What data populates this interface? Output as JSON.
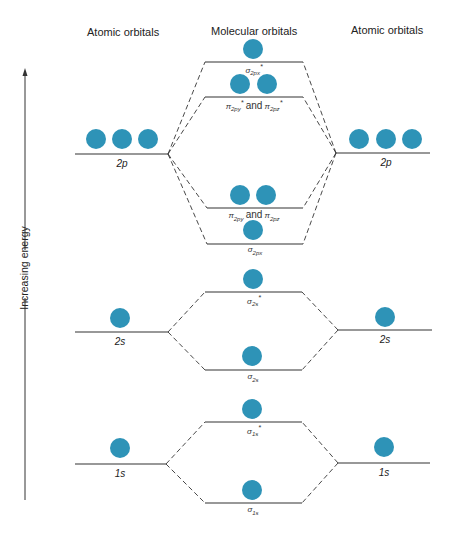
{
  "headers": {
    "left": "Atomic orbitals",
    "middle": "Molecular orbitals",
    "right": "Atomic orbitals"
  },
  "axis": {
    "label": "Increasing energy"
  },
  "colors": {
    "electron": "#2e93b7",
    "line": "#333333"
  },
  "atomic_orbitals": {
    "left": [
      {
        "label": "2p",
        "electrons": 3
      },
      {
        "label": "2s",
        "electrons": 1
      },
      {
        "label": "1s",
        "electrons": 1
      }
    ],
    "right": [
      {
        "label": "2p",
        "electrons": 3
      },
      {
        "label": "2s",
        "electrons": 1
      },
      {
        "label": "1s",
        "electrons": 1
      }
    ]
  },
  "molecular_orbitals": [
    {
      "name": "σ2px*",
      "sym": "σ",
      "sub": "2px",
      "star": "*",
      "electrons": 1
    },
    {
      "name": "π2py* and π2pz*",
      "sym1": "π",
      "sub1": "2py",
      "sym2": "π",
      "sub2": "2pz",
      "star": "*",
      "and": "and",
      "electrons": 2
    },
    {
      "name": "π2py and π2pz",
      "sym1": "π",
      "sub1": "2py",
      "sym2": "π",
      "sub2": "2pz",
      "and": "and",
      "electrons": 2
    },
    {
      "name": "σ2px",
      "sym": "σ",
      "sub": "2px",
      "electrons": 1
    },
    {
      "name": "σ2s*",
      "sym": "σ",
      "sub": "2s",
      "star": "*",
      "electrons": 1
    },
    {
      "name": "σ2s",
      "sym": "σ",
      "sub": "2s",
      "electrons": 1
    },
    {
      "name": "σ1s*",
      "sym": "σ",
      "sub": "1s",
      "star": "*",
      "electrons": 1
    },
    {
      "name": "σ1s",
      "sym": "σ",
      "sub": "1s",
      "electrons": 1
    }
  ]
}
